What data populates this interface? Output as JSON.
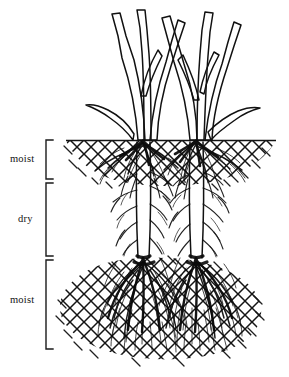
{
  "figure": {
    "width": 289,
    "height": 377,
    "background_color": "#ffffff",
    "ink_color": "#111111"
  },
  "soil_surface": {
    "label": "soil-surface-line",
    "y": 140,
    "x_start": 66,
    "x_end": 276
  },
  "zones": [
    {
      "id": "upper-moist",
      "label": "moist",
      "label_x": 10,
      "label_y": 162,
      "bracket_x": 46,
      "bracket_top": 140,
      "bracket_bottom": 179,
      "bracket_tick": 7,
      "moisture": "moist",
      "hatching": true,
      "root_density": "dense",
      "depth_top": 140,
      "depth_bottom": 179
    },
    {
      "id": "middle-dry",
      "label": "dry",
      "label_x": 18,
      "label_y": 222,
      "bracket_x": 46,
      "bracket_top": 183,
      "bracket_bottom": 256,
      "bracket_tick": 7,
      "moisture": "dry",
      "hatching": false,
      "root_density": "sparse",
      "depth_top": 183,
      "depth_bottom": 256
    },
    {
      "id": "lower-moist",
      "label": "moist",
      "label_x": 10,
      "label_y": 303,
      "bracket_x": 46,
      "bracket_top": 260,
      "bracket_bottom": 349,
      "bracket_tick": 7,
      "moisture": "moist",
      "hatching": true,
      "root_density": "very-dense",
      "depth_top": 260,
      "depth_bottom": 349
    }
  ],
  "plant": {
    "type": "grass",
    "clumps": 2,
    "clump_centers_x": [
      143,
      196
    ],
    "shoot_top_y": 12,
    "blade_count": 11,
    "taproots_x": [
      143,
      196
    ]
  },
  "legend_notes": {
    "interpretation": "Roots proliferate densely in moist soil layers and remain sparse, with only thin lateral strands, through the intervening dry layer."
  }
}
